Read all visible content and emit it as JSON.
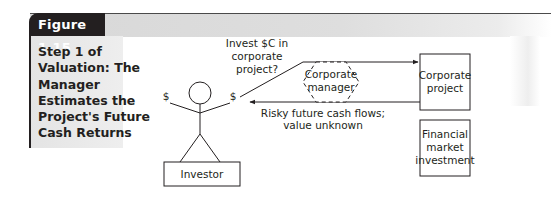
{
  "figure": {
    "number_label": "Figure 1.15",
    "caption_lines": [
      "Step 1 of",
      "Valuation: The",
      "Manager",
      "Estimates the",
      "Project's Future",
      "Cash Returns"
    ]
  },
  "diagram": {
    "investor_label": "Investor",
    "dollar_left": "$",
    "dollar_right": "$",
    "invest_question": [
      "Invest $C in",
      "corporate",
      "project?"
    ],
    "manager_label": [
      "Corporate",
      "manager"
    ],
    "cash_flows_label": [
      "Risky future cash flows;",
      "value unknown"
    ],
    "corporate_project_label": [
      "Corporate",
      "project"
    ],
    "financial_market_label": [
      "Financial",
      "market",
      "investment"
    ]
  },
  "colors": {
    "tab_bg": "#231f20",
    "bar_bg": "#d8d8d8",
    "line": "#231f20"
  }
}
